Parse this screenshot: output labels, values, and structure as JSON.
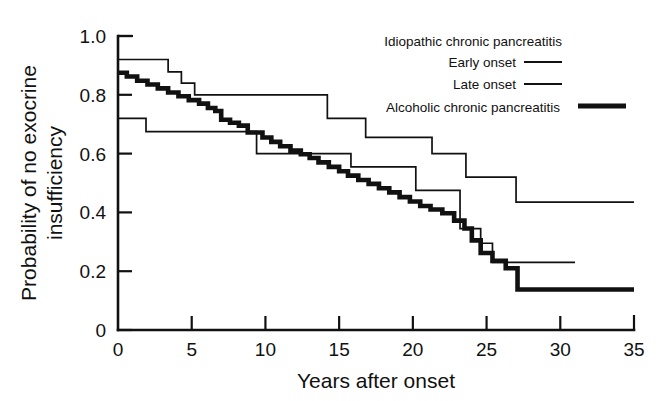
{
  "chart_data": {
    "type": "line",
    "subtype": "kaplan-meier-step",
    "title": "",
    "xlabel": "Years after onset",
    "ylabel": "Probability of no exocrine insufficiency",
    "ylabel_line1": "Probability of no exocrine",
    "ylabel_line2": "insufficiency",
    "xlim": [
      0,
      35
    ],
    "ylim": [
      0,
      1.0
    ],
    "xticks": [
      0,
      5,
      10,
      15,
      20,
      25,
      30,
      35
    ],
    "xticklabels": [
      "0",
      "5",
      "10",
      "15",
      "20",
      "25",
      "30",
      "35"
    ],
    "yticks": [
      0,
      0.2,
      0.4,
      0.6,
      0.8,
      1.0
    ],
    "yticklabels": [
      "0",
      "0.2",
      "0.4",
      "0.6",
      "0.8",
      "1.0"
    ],
    "grid": false,
    "legend_position": "top-right",
    "legend_title": "Idiopathic chronic pancreatitis",
    "series": [
      {
        "name": "Early onset",
        "style": "thin",
        "color": "#111111",
        "linewidth": 1.7,
        "points": [
          [
            0.0,
            1.0
          ],
          [
            0.0,
            0.92
          ],
          [
            3.4,
            0.92
          ],
          [
            3.4,
            0.878
          ],
          [
            4.3,
            0.878
          ],
          [
            4.3,
            0.84
          ],
          [
            5.2,
            0.84
          ],
          [
            5.2,
            0.8
          ],
          [
            14.2,
            0.8
          ],
          [
            14.2,
            0.72
          ],
          [
            16.8,
            0.72
          ],
          [
            16.8,
            0.655
          ],
          [
            21.3,
            0.655
          ],
          [
            21.3,
            0.6
          ],
          [
            23.6,
            0.6
          ],
          [
            23.6,
            0.52
          ],
          [
            27.0,
            0.52
          ],
          [
            27.0,
            0.435
          ],
          [
            35.0,
            0.435
          ]
        ]
      },
      {
        "name": "Late onset",
        "style": "thin",
        "color": "#111111",
        "linewidth": 1.7,
        "points": [
          [
            0.0,
            0.78
          ],
          [
            0.0,
            0.72
          ],
          [
            1.9,
            0.72
          ],
          [
            1.9,
            0.675
          ],
          [
            9.4,
            0.675
          ],
          [
            9.4,
            0.6
          ],
          [
            15.8,
            0.6
          ],
          [
            15.8,
            0.555
          ],
          [
            20.2,
            0.555
          ],
          [
            20.2,
            0.475
          ],
          [
            23.2,
            0.475
          ],
          [
            23.2,
            0.345
          ],
          [
            24.6,
            0.345
          ],
          [
            24.6,
            0.295
          ],
          [
            25.4,
            0.295
          ],
          [
            25.4,
            0.23
          ],
          [
            31.0,
            0.23
          ]
        ]
      },
      {
        "name": "Alcoholic chronic pancreatitis",
        "style": "thick",
        "color": "#111111",
        "linewidth": 4.6,
        "points": [
          [
            0.0,
            0.875
          ],
          [
            0.6,
            0.875
          ],
          [
            0.6,
            0.862
          ],
          [
            1.3,
            0.862
          ],
          [
            1.3,
            0.848
          ],
          [
            2.0,
            0.848
          ],
          [
            2.0,
            0.835
          ],
          [
            2.7,
            0.835
          ],
          [
            2.7,
            0.822
          ],
          [
            3.4,
            0.822
          ],
          [
            3.4,
            0.808
          ],
          [
            4.1,
            0.808
          ],
          [
            4.1,
            0.795
          ],
          [
            4.8,
            0.795
          ],
          [
            4.8,
            0.782
          ],
          [
            5.5,
            0.782
          ],
          [
            5.5,
            0.77
          ],
          [
            6.1,
            0.77
          ],
          [
            6.1,
            0.755
          ],
          [
            6.6,
            0.755
          ],
          [
            6.6,
            0.745
          ],
          [
            7.0,
            0.745
          ],
          [
            7.0,
            0.715
          ],
          [
            7.6,
            0.715
          ],
          [
            7.6,
            0.705
          ],
          [
            8.2,
            0.705
          ],
          [
            8.2,
            0.695
          ],
          [
            8.8,
            0.695
          ],
          [
            8.8,
            0.672
          ],
          [
            9.8,
            0.672
          ],
          [
            9.8,
            0.655
          ],
          [
            10.4,
            0.655
          ],
          [
            10.4,
            0.64
          ],
          [
            11.0,
            0.64
          ],
          [
            11.0,
            0.625
          ],
          [
            11.7,
            0.625
          ],
          [
            11.7,
            0.61
          ],
          [
            12.4,
            0.61
          ],
          [
            12.4,
            0.598
          ],
          [
            13.0,
            0.598
          ],
          [
            13.0,
            0.585
          ],
          [
            13.6,
            0.585
          ],
          [
            13.6,
            0.57
          ],
          [
            14.3,
            0.57
          ],
          [
            14.3,
            0.555
          ],
          [
            15.0,
            0.555
          ],
          [
            15.0,
            0.54
          ],
          [
            15.6,
            0.54
          ],
          [
            15.6,
            0.525
          ],
          [
            16.3,
            0.525
          ],
          [
            16.3,
            0.51
          ],
          [
            17.0,
            0.51
          ],
          [
            17.0,
            0.497
          ],
          [
            17.7,
            0.497
          ],
          [
            17.7,
            0.482
          ],
          [
            18.4,
            0.482
          ],
          [
            18.4,
            0.468
          ],
          [
            19.1,
            0.468
          ],
          [
            19.1,
            0.452
          ],
          [
            19.8,
            0.452
          ],
          [
            19.8,
            0.437
          ],
          [
            20.5,
            0.437
          ],
          [
            20.5,
            0.422
          ],
          [
            21.2,
            0.422
          ],
          [
            21.2,
            0.41
          ],
          [
            22.0,
            0.41
          ],
          [
            22.0,
            0.397
          ],
          [
            22.8,
            0.397
          ],
          [
            22.8,
            0.372
          ],
          [
            23.5,
            0.372
          ],
          [
            23.5,
            0.345
          ],
          [
            24.0,
            0.345
          ],
          [
            24.0,
            0.305
          ],
          [
            24.6,
            0.305
          ],
          [
            24.6,
            0.262
          ],
          [
            25.4,
            0.262
          ],
          [
            25.4,
            0.235
          ],
          [
            26.3,
            0.235
          ],
          [
            26.3,
            0.21
          ],
          [
            27.1,
            0.21
          ],
          [
            27.1,
            0.138
          ],
          [
            35.0,
            0.138
          ]
        ]
      }
    ]
  },
  "legend": {
    "title": "Idiopathic chronic pancreatitis",
    "entries": [
      {
        "label": "Early onset",
        "style": "thin"
      },
      {
        "label": "Late onset",
        "style": "thin"
      },
      {
        "label": "Alcoholic chronic pancreatitis",
        "style": "thick"
      }
    ]
  }
}
